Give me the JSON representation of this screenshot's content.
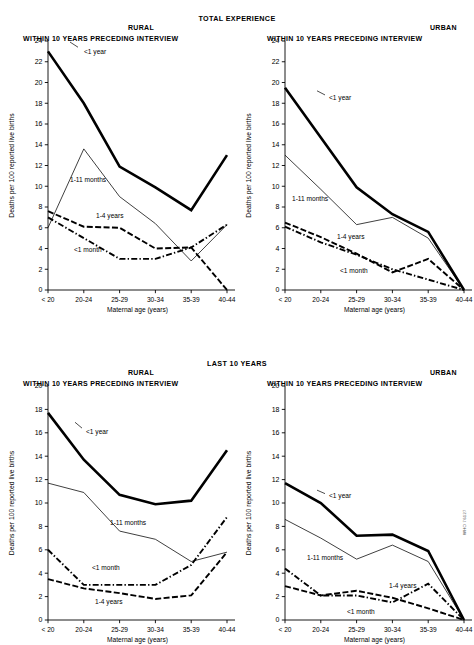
{
  "figure": {
    "y_axis_label": "Deaths per 100 reported live births",
    "x_axis_label": "Maternal age (years)",
    "categories": [
      "< 20",
      "20-24",
      "25-29",
      "30-34",
      "35-39",
      "40-44"
    ],
    "subtitle": "WITHIN 10 YEARS PRECEDING INTERVIEW",
    "area_rural": "RURAL",
    "area_urban": "URBAN",
    "figure_id": "WHO 76127",
    "series_labels": {
      "under1year": "<1 year",
      "months1to11": "1-11 months",
      "years1to4": "1-4 years",
      "under1month": "<1 month"
    }
  },
  "panels": {
    "total": {
      "title": "TOTAL EXPERIENCE"
    },
    "last10": {
      "title": "LAST 10 YEARS"
    }
  },
  "chart_data": [
    {
      "id": "total-rural",
      "type": "line",
      "title": "TOTAL EXPERIENCE",
      "area": "RURAL",
      "subtitle": "WITHIN 10 YEARS PRECEDING INTERVIEW",
      "xlabel": "Maternal age (years)",
      "ylabel": "Deaths per 100 reported live births",
      "categories": [
        "< 20",
        "20-24",
        "25-29",
        "30-34",
        "35-39",
        "40-44"
      ],
      "ylim": [
        0,
        24
      ],
      "ytick_step": 2,
      "grid": false,
      "legend": "inline-annotations",
      "series": [
        {
          "name": "<1 year",
          "style": "thick-solid",
          "values": [
            23.0,
            18.0,
            11.9,
            9.9,
            7.7,
            13.0
          ]
        },
        {
          "name": "1-11 months",
          "style": "thin-solid",
          "values": [
            6.0,
            13.6,
            9.0,
            6.4,
            2.8,
            6.3
          ]
        },
        {
          "name": "1-4 years",
          "style": "dashed",
          "values": [
            7.6,
            6.1,
            6.0,
            4.0,
            4.1,
            0.0
          ]
        },
        {
          "name": "<1 month",
          "style": "dash-dot",
          "values": [
            7.0,
            5.0,
            3.0,
            3.0,
            4.1,
            6.3
          ]
        }
      ]
    },
    {
      "id": "total-urban",
      "type": "line",
      "title": "TOTAL EXPERIENCE",
      "area": "URBAN",
      "subtitle": "WITHIN 10 YEARS PRECEDING INTERVIEW",
      "xlabel": "Maternal age (years)",
      "ylabel": "Deaths per 100 reported live births",
      "categories": [
        "< 20",
        "20-24",
        "25-29",
        "30-34",
        "35-39",
        "40-44"
      ],
      "ylim": [
        0,
        24
      ],
      "ytick_step": 2,
      "grid": false,
      "legend": "inline-annotations",
      "series": [
        {
          "name": "<1 year",
          "style": "thick-solid",
          "values": [
            19.5,
            14.7,
            9.9,
            7.3,
            5.6,
            0.0
          ]
        },
        {
          "name": "1-11 months",
          "style": "thin-solid",
          "values": [
            13.0,
            9.7,
            6.3,
            7.0,
            5.0,
            0.0
          ]
        },
        {
          "name": "1-4 years",
          "style": "dashed",
          "values": [
            6.5,
            5.1,
            3.5,
            1.7,
            3.0,
            0.0
          ]
        },
        {
          "name": "<1 month",
          "style": "dash-dot",
          "values": [
            6.1,
            4.6,
            3.4,
            2.0,
            1.0,
            0.0
          ]
        }
      ]
    },
    {
      "id": "last10-rural",
      "type": "line",
      "title": "LAST 10 YEARS",
      "area": "RURAL",
      "subtitle": "WITHIN 10 YEARS PRECEDING INTERVIEW",
      "xlabel": "Maternal age (years)",
      "ylabel": "Deaths per 100 reported live births",
      "categories": [
        "< 20",
        "20-24",
        "25-29",
        "30-34",
        "35-39",
        "40-44"
      ],
      "ylim": [
        0,
        20
      ],
      "ytick_step": 2,
      "grid": false,
      "legend": "inline-annotations",
      "series": [
        {
          "name": "<1 year",
          "style": "thick-solid",
          "values": [
            17.7,
            13.7,
            10.7,
            9.9,
            10.2,
            14.5
          ]
        },
        {
          "name": "1-11 months",
          "style": "thin-solid",
          "values": [
            11.7,
            10.9,
            7.6,
            6.9,
            5.0,
            5.8
          ]
        },
        {
          "name": "<1 month",
          "style": "dash-dot",
          "values": [
            6.0,
            3.0,
            3.0,
            3.0,
            4.7,
            8.8
          ]
        },
        {
          "name": "1-4 years",
          "style": "dashed",
          "values": [
            3.5,
            2.7,
            2.3,
            1.8,
            2.1,
            5.8
          ]
        }
      ]
    },
    {
      "id": "last10-urban",
      "type": "line",
      "title": "LAST 10 YEARS",
      "area": "URBAN",
      "subtitle": "WITHIN 10 YEARS PRECEDING INTERVIEW",
      "xlabel": "Maternal age (years)",
      "ylabel": "Deaths per 100 reported live births",
      "categories": [
        "< 20",
        "20-24",
        "25-29",
        "30-34",
        "35-39",
        "40-44"
      ],
      "ylim": [
        0,
        20
      ],
      "ytick_step": 2,
      "grid": false,
      "legend": "inline-annotations",
      "series": [
        {
          "name": "<1 year",
          "style": "thick-solid",
          "values": [
            11.7,
            10.0,
            7.2,
            7.3,
            5.9,
            0.0
          ]
        },
        {
          "name": "1-11 months",
          "style": "thin-solid",
          "values": [
            8.6,
            7.0,
            5.2,
            6.4,
            5.0,
            0.0
          ]
        },
        {
          "name": "<1 month",
          "style": "dash-dot",
          "values": [
            4.4,
            2.1,
            2.1,
            1.5,
            3.1,
            0.0
          ]
        },
        {
          "name": "1-4 years",
          "style": "dashed",
          "values": [
            2.9,
            2.1,
            2.5,
            1.9,
            1.0,
            0.0
          ]
        }
      ]
    }
  ],
  "annotations": {
    "total-rural": [
      {
        "label": "<1 year",
        "x": 36,
        "y": 23.0,
        "anchor": "start",
        "leader": [
          [
            30,
            23.4
          ],
          [
            22,
            23.9
          ]
        ]
      },
      {
        "label": "1-11 months",
        "x": 22,
        "y": 10.6,
        "anchor": "start",
        "leader": null
      },
      {
        "label": "1-4 years",
        "x": 48,
        "y": 7.15,
        "anchor": "start",
        "leader": null
      },
      {
        "label": "<1 month",
        "x": 26,
        "y": 3.9,
        "anchor": "start",
        "leader": null
      }
    ],
    "total-urban": [
      {
        "label": "<1 year",
        "x": 44,
        "y": 18.5,
        "anchor": "start",
        "leader": [
          [
            40,
            18.8
          ],
          [
            32,
            19.2
          ]
        ]
      },
      {
        "label": "1-11 months",
        "x": 7,
        "y": 8.8,
        "anchor": "start",
        "leader": null
      },
      {
        "label": "1-4 years",
        "x": 52,
        "y": 5.15,
        "anchor": "start",
        "leader": null
      },
      {
        "label": "<1 month",
        "x": 55,
        "y": 1.85,
        "anchor": "start",
        "leader": null
      }
    ],
    "last10-rural": [
      {
        "label": "<1 year",
        "x": 38,
        "y": 16.1,
        "anchor": "start",
        "leader": [
          [
            34,
            16.4
          ],
          [
            27,
            16.9
          ]
        ]
      },
      {
        "label": "1-11 months",
        "x": 62,
        "y": 8.3,
        "anchor": "start",
        "leader": null
      },
      {
        "label": "<1 month",
        "x": 44,
        "y": 4.5,
        "anchor": "start",
        "leader": null
      },
      {
        "label": "1-4 years",
        "x": 47,
        "y": 1.55,
        "anchor": "start",
        "leader": null
      }
    ],
    "last10-urban": [
      {
        "label": "<1 year",
        "x": 44,
        "y": 10.6,
        "anchor": "start",
        "leader": [
          [
            40,
            10.8
          ],
          [
            32,
            11.1
          ]
        ]
      },
      {
        "label": "1-11 months",
        "x": 22,
        "y": 5.3,
        "anchor": "start",
        "leader": null
      },
      {
        "label": "1-4 years",
        "x": 104,
        "y": 2.9,
        "anchor": "start",
        "leader": null
      },
      {
        "label": "<1 month",
        "x": 62,
        "y": 0.75,
        "anchor": "start",
        "leader": null
      }
    ]
  }
}
